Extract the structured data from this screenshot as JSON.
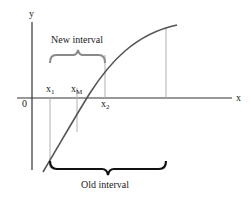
{
  "diagram": {
    "type": "bisection-interval-illustration",
    "axes": {
      "x_label": "x",
      "y_label": "y",
      "origin_label": "0"
    },
    "points": [
      {
        "name": "x1",
        "base": "x",
        "subscript": "1"
      },
      {
        "name": "xM",
        "base": "x",
        "subscript": "M"
      },
      {
        "name": "x2",
        "base": "x",
        "subscript": "2"
      }
    ],
    "braces": {
      "new_interval_label": "New interval",
      "old_interval_label": "Old interval"
    },
    "colors": {
      "axis": "#333333",
      "curve": "#555555",
      "guide_lines": "#b0b0b0",
      "brace": "#111111",
      "new_brace": "#8a8a8a",
      "text": "#1a1a1a"
    }
  }
}
